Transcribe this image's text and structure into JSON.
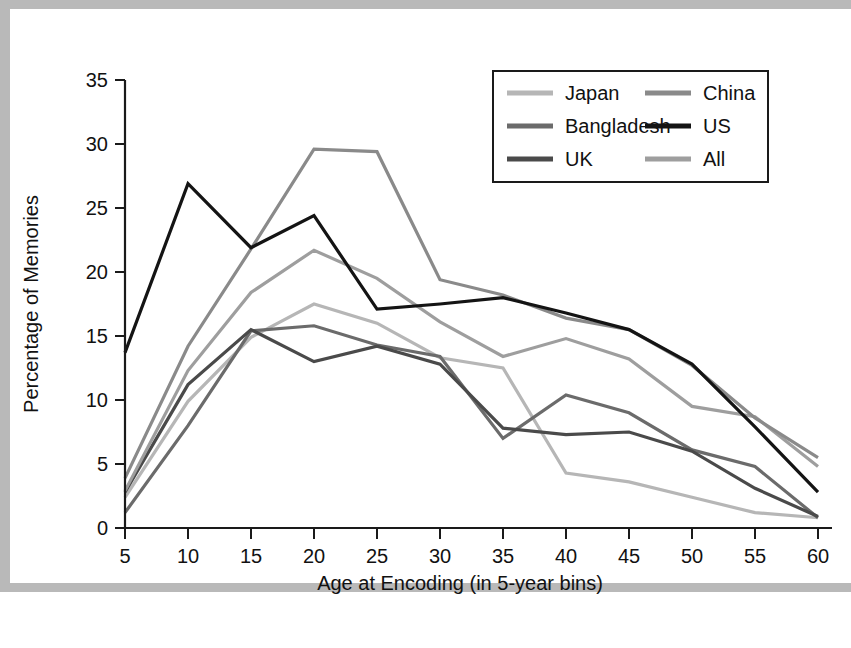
{
  "chart_data": {
    "type": "line",
    "title": "",
    "xlabel": "Age at Encoding (in 5-year bins)",
    "ylabel": "Percentage of Memories",
    "x": [
      5,
      10,
      15,
      20,
      25,
      30,
      35,
      40,
      45,
      50,
      55,
      60
    ],
    "xticklabels": [
      "5",
      "10",
      "15",
      "20",
      "25",
      "30",
      "35",
      "40",
      "45",
      "50",
      "55",
      "60"
    ],
    "yticklabels": [
      "0",
      "5",
      "10",
      "15",
      "20",
      "25",
      "30",
      "35"
    ],
    "xlim": [
      5,
      60
    ],
    "ylim": [
      0,
      35
    ],
    "ytick_step": 5,
    "grid": false,
    "legend_position": "top-right",
    "legend_columns": 2,
    "series": [
      {
        "name": "Japan",
        "color": "#b6b6b6",
        "values": [
          2.4,
          9.9,
          14.9,
          17.5,
          16.0,
          13.3,
          12.5,
          4.3,
          3.6,
          2.4,
          1.2,
          0.8
        ]
      },
      {
        "name": "Bangladesh",
        "color": "#6b6b6b",
        "values": [
          1.2,
          8.0,
          15.4,
          15.8,
          14.3,
          13.4,
          7.0,
          10.4,
          9.0,
          6.1,
          4.8,
          0.8
        ]
      },
      {
        "name": "UK",
        "color": "#4a4a4a",
        "values": [
          2.8,
          11.2,
          15.5,
          13.0,
          14.2,
          12.8,
          7.8,
          7.3,
          7.5,
          6.0,
          3.1,
          0.9
        ]
      },
      {
        "name": "China",
        "color": "#8a8a8a",
        "values": [
          3.9,
          14.2,
          21.8,
          29.6,
          29.4,
          19.4,
          18.2,
          16.4,
          15.5,
          12.7,
          8.6,
          5.5
        ]
      },
      {
        "name": "US",
        "color": "#141414",
        "values": [
          13.7,
          26.9,
          21.9,
          24.4,
          17.1,
          17.5,
          18.0,
          16.8,
          15.5,
          12.8,
          7.9,
          2.8
        ]
      },
      {
        "name": "All",
        "color": "#9e9e9e",
        "values": [
          2.9,
          12.3,
          18.4,
          21.7,
          19.5,
          16.1,
          13.4,
          14.8,
          13.2,
          9.5,
          8.7,
          4.8
        ]
      }
    ]
  },
  "legend": {
    "items": [
      {
        "label": "Japan"
      },
      {
        "label": "China"
      },
      {
        "label": "Bangladesh"
      },
      {
        "label": "US"
      },
      {
        "label": "UK"
      },
      {
        "label": "All"
      }
    ]
  },
  "axes": {
    "y_title": "Percentage of Memories",
    "x_title": "Age at Encoding (in 5-year bins)"
  }
}
